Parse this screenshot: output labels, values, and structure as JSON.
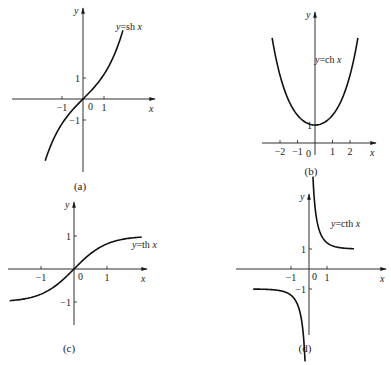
{
  "chart_data": [
    {
      "type": "line",
      "panel": "(a)",
      "title": "",
      "caption": "(a)",
      "curve_label": "y=sh x",
      "function": "sinh",
      "xlabel": "x",
      "ylabel": "y",
      "x_ticks": [
        "-1",
        "0",
        "1"
      ],
      "y_ticks": [
        "1",
        "-1"
      ],
      "xlim": [
        -2.2,
        2.6
      ],
      "ylim": [
        -3.6,
        4.3
      ],
      "grid": false,
      "series": [
        {
          "name": "y=sh x",
          "x": [
            -1.8,
            -1.5,
            -1.0,
            -0.5,
            0,
            0.5,
            1.0,
            1.5,
            1.9
          ],
          "y": [
            -2.94,
            -2.13,
            -1.18,
            -0.52,
            0,
            0.52,
            1.18,
            2.13,
            3.27
          ]
        }
      ]
    },
    {
      "type": "line",
      "panel": "(b)",
      "caption": "(b)",
      "curve_label": "y=ch x",
      "function": "cosh",
      "xlabel": "x",
      "ylabel": "y",
      "x_ticks": [
        "-2",
        "-1",
        "0",
        "1",
        "2"
      ],
      "y_ticks": [
        "1"
      ],
      "xlim": [
        -2.6,
        2.6
      ],
      "ylim": [
        0,
        6.5
      ],
      "grid": false,
      "series": [
        {
          "name": "y=ch x",
          "x": [
            -2.5,
            -2,
            -1,
            0,
            1,
            2,
            2.5
          ],
          "y": [
            6.13,
            3.76,
            1.54,
            1,
            1.54,
            3.76,
            6.13
          ]
        }
      ]
    },
    {
      "type": "line",
      "panel": "(c)",
      "caption": "(c)",
      "curve_label": "y=th x",
      "function": "tanh",
      "xlabel": "x",
      "ylabel": "y",
      "x_ticks": [
        "-1",
        "0",
        "1"
      ],
      "y_ticks": [
        "1",
        "-1"
      ],
      "xlim": [
        -2.0,
        2.0
      ],
      "ylim": [
        -1.6,
        1.6
      ],
      "grid": false,
      "series": [
        {
          "name": "y=th x",
          "x": [
            -1.95,
            -1,
            -0.5,
            0,
            0.5,
            1,
            2.0
          ],
          "y": [
            -0.96,
            -0.76,
            -0.46,
            0,
            0.46,
            0.76,
            0.96
          ]
        }
      ]
    },
    {
      "type": "line",
      "panel": "(d)",
      "caption": "(d)",
      "curve_label": "y=cth x",
      "function": "coth",
      "xlabel": "x",
      "ylabel": "y",
      "x_ticks": [
        "-1",
        "0",
        "1"
      ],
      "y_ticks": [
        "1",
        "-1"
      ],
      "xlim": [
        -3.5,
        3.5
      ],
      "ylim": [
        -3.6,
        3.7
      ],
      "grid": false,
      "series": [
        {
          "name": "y=cth x (x>0)",
          "x": [
            0.28,
            0.5,
            1,
            1.5,
            2.5
          ],
          "y": [
            3.66,
            2.16,
            1.31,
            1.1,
            1.01
          ]
        },
        {
          "name": "y=cth x (x<0)",
          "x": [
            -3.3,
            -2,
            -1,
            -0.5,
            -0.28
          ],
          "y": [
            -1.0,
            -1.04,
            -1.31,
            -2.16,
            -3.66
          ]
        }
      ]
    }
  ],
  "panels": [
    {
      "id": "a",
      "caption": "(a)",
      "label": "y=sh x",
      "xaxis": "x",
      "yaxis": "y",
      "xt": [
        {
          "v": -1,
          "t": "-1"
        },
        {
          "v": 1,
          "t": "1"
        }
      ],
      "yt": [
        {
          "v": 1,
          "t": "1"
        },
        {
          "v": -1,
          "t": "-1"
        }
      ],
      "zero": "0",
      "ox": 83,
      "oy": 99,
      "ux": 21,
      "uy": 21,
      "xa": [
        12,
        155
      ],
      "ya": [
        8,
        172
      ],
      "fn": "sinh",
      "ranges": [
        [
          -1.8,
          1.9
        ]
      ],
      "labelPos": [
        116,
        30
      ],
      "capPos": [
        80,
        190
      ],
      "zeroPos": [
        88,
        110
      ]
    },
    {
      "id": "b",
      "caption": "(b)",
      "label": "y=ch x",
      "xaxis": "x",
      "yaxis": "y",
      "xt": [
        {
          "v": -2,
          "t": "-2"
        },
        {
          "v": -1,
          "t": "-1"
        },
        {
          "v": 1,
          "t": "1"
        },
        {
          "v": 2,
          "t": "2"
        }
      ],
      "yt": [
        {
          "v": 1,
          "t": "1"
        }
      ],
      "zero": "0",
      "ox": 315,
      "oy": 143,
      "ux": 17.5,
      "uy": 18,
      "xa": [
        262,
        376
      ],
      "ya": [
        12,
        155
      ],
      "fn": "cosh",
      "ranges": [
        [
          -2.45,
          2.45
        ]
      ],
      "labelPos": [
        315,
        63
      ],
      "capPos": [
        311,
        175
      ],
      "zeroPos": [
        306,
        157
      ]
    },
    {
      "id": "c",
      "caption": "(c)",
      "label": "y=th x",
      "xaxis": "x",
      "yaxis": "y",
      "xt": [
        {
          "v": -1,
          "t": "-1"
        },
        {
          "v": 1,
          "t": "1"
        }
      ],
      "yt": [
        {
          "v": 1,
          "t": "1"
        },
        {
          "v": -1,
          "t": "-1"
        }
      ],
      "zero": "0",
      "ox": 74,
      "oy": 269,
      "ux": 33,
      "uy": 33,
      "xa": [
        8,
        147
      ],
      "ya": [
        202,
        325
      ],
      "fn": "tanh",
      "ranges": [
        [
          -1.95,
          2.05
        ]
      ],
      "labelPos": [
        132,
        248
      ],
      "capPos": [
        69,
        352
      ],
      "zeroPos": [
        78,
        280
      ]
    },
    {
      "id": "d",
      "caption": "(d)",
      "label": "y=cth x",
      "xaxis": "x",
      "yaxis": "y",
      "xt": [
        {
          "v": -1,
          "t": "-1"
        },
        {
          "v": 1,
          "t": "1"
        }
      ],
      "yt": [
        {
          "v": 1,
          "t": "1"
        },
        {
          "v": -1,
          "t": "-1"
        }
      ],
      "zero": "0",
      "ox": 309,
      "oy": 269,
      "ux": 18,
      "uy": 20,
      "xa": [
        236,
        386
      ],
      "ya": [
        194,
        335
      ],
      "fn": "coth",
      "ranges": [
        [
          0.22,
          2.5
        ],
        [
          -3.1,
          -0.22
        ]
      ],
      "labelPos": [
        331,
        227
      ],
      "capPos": [
        305,
        352
      ],
      "zeroPos": [
        312,
        280
      ]
    }
  ]
}
